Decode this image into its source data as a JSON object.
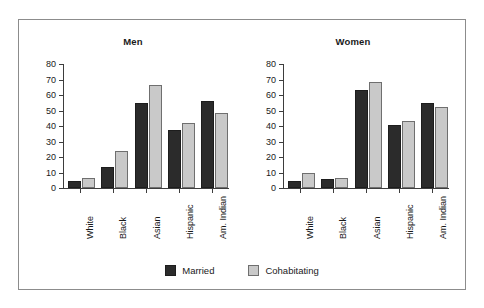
{
  "chart_data": {
    "type": "bar",
    "title": "",
    "categories": [
      "White",
      "Black",
      "Asian",
      "Hispanic",
      "Am. Indian"
    ],
    "panels": [
      {
        "title": "Men",
        "xlabel": "",
        "ylabel": "",
        "ylim": [
          0,
          80
        ],
        "yticks": [
          0,
          10,
          20,
          30,
          40,
          50,
          60,
          70,
          80
        ],
        "grid": false,
        "series": [
          {
            "name": "Married",
            "values": [
              4.5,
              13.5,
              55,
              37.5,
              56
            ]
          },
          {
            "name": "Cohabitating",
            "values": [
              6.5,
              24,
              66.5,
              42,
              48.5
            ]
          }
        ]
      },
      {
        "title": "Women",
        "xlabel": "",
        "ylabel": "",
        "ylim": [
          0,
          80
        ],
        "yticks": [
          0,
          10,
          20,
          30,
          40,
          50,
          60,
          70,
          80
        ],
        "grid": false,
        "series": [
          {
            "name": "Married",
            "values": [
              4.5,
              5.5,
              63.5,
              40.5,
              55
            ]
          },
          {
            "name": "Cohabitating",
            "values": [
              9.5,
              6.5,
              68.5,
              43.5,
              52
            ]
          }
        ]
      }
    ],
    "legend": {
      "position": "bottom-center",
      "entries": [
        {
          "label": "Married",
          "color": "#2b2b2b"
        },
        {
          "label": "Cohabitating",
          "color": "#c9c9c9"
        }
      ]
    }
  }
}
